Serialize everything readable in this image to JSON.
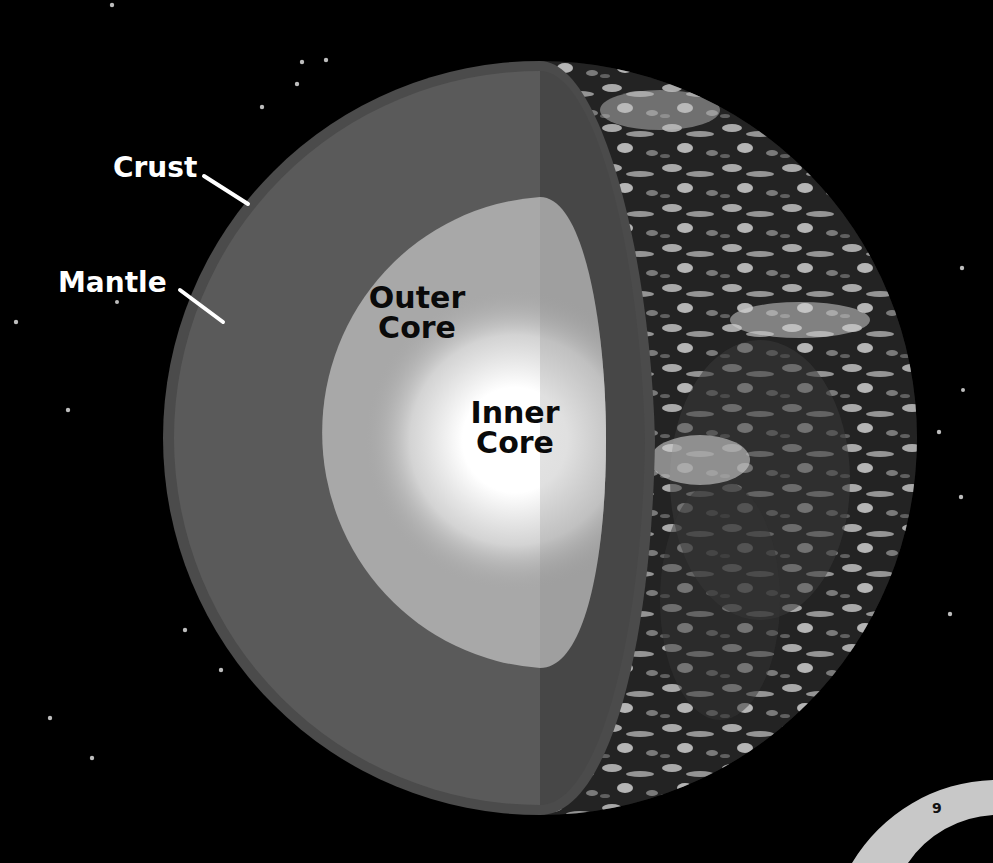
{
  "diagram": {
    "labels": {
      "crust": "Crust",
      "mantle": "Mantle",
      "outer_core_line1": "Outer",
      "outer_core_line2": "Core",
      "inner_core_line1": "Inner",
      "inner_core_line2": "Core"
    },
    "layers": [
      {
        "name": "Crust",
        "color": "#4b4b4b"
      },
      {
        "name": "Mantle",
        "color": "#5a5a5a"
      },
      {
        "name": "Outer Core",
        "color": "#a9a9a9"
      },
      {
        "name": "Inner Core",
        "color": "#ffffff"
      }
    ],
    "background": "#000000",
    "cut_face_color": "#474747",
    "page_number": "9",
    "page_tab_color": "#c8c8c8"
  }
}
